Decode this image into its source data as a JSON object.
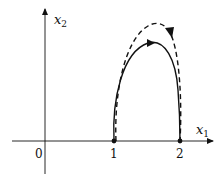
{
  "diagram": {
    "type": "phase-plane",
    "axes": {
      "x_label": "x",
      "x_sub": "1",
      "y_label": "x",
      "y_sub": "2",
      "origin_label": "0"
    },
    "ticks": [
      {
        "label": "1",
        "value": 1
      },
      {
        "label": "2",
        "value": 2
      }
    ],
    "points": [
      {
        "name": "point-1",
        "x": 1,
        "y": 0
      },
      {
        "name": "point-2",
        "x": 2,
        "y": 0
      }
    ],
    "curves": [
      {
        "name": "solid-trajectory",
        "style": "solid",
        "from": [
          1,
          0
        ],
        "to": [
          2,
          0
        ],
        "direction": "clockwise"
      },
      {
        "name": "dashed-trajectory",
        "style": "dashed",
        "from": [
          1,
          0
        ],
        "to": [
          2,
          0
        ],
        "direction": "clockwise"
      }
    ],
    "colors": {
      "stroke": "#111111",
      "background": "#ffffff"
    }
  }
}
